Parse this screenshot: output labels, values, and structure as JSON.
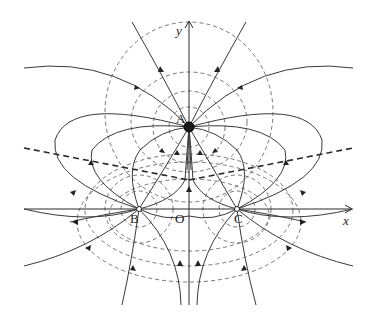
{
  "figure": {
    "type": "electric field lines and equipotential surfaces",
    "labels": {
      "y_axis": "y",
      "x_axis": "x",
      "charge_a": "A",
      "charge_b": "B",
      "charge_c": "C",
      "origin": "O"
    },
    "points": [
      {
        "name": "A",
        "kind": "charge",
        "fill": "#1a1a1a"
      },
      {
        "name": "B",
        "kind": "charge",
        "fill": "#ffffff"
      },
      {
        "name": "C",
        "kind": "charge",
        "fill": "#ffffff"
      }
    ],
    "legend": {
      "solid_lines": "electric field lines",
      "dashed_lines": "equipotential lines"
    }
  }
}
